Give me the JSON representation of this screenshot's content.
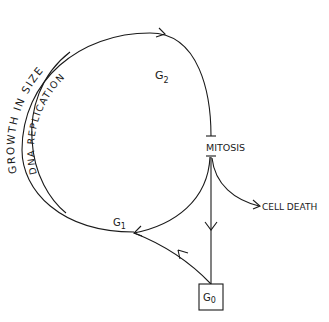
{
  "diagram": {
    "labels": {
      "growth": "GROWTH IN SIZE",
      "dna": "DNA REPLICATION",
      "g2": "G",
      "g2_sub": "2",
      "mitosis": "MITOSIS",
      "cell_death": "CELL DEATH",
      "g1": "G",
      "g1_sub": "1",
      "g0": "G",
      "g0_sub": "0"
    },
    "colors": {
      "ink": "#1a1a1a",
      "background": "#ffffff"
    }
  }
}
